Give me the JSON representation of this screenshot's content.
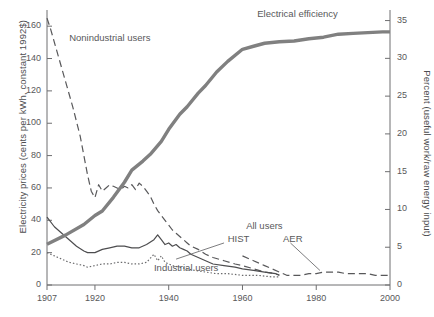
{
  "chart_data": {
    "type": "line",
    "title": "",
    "xlabel": "",
    "ylabel": "Electricity prices (cents per kWh, constant 1992$)",
    "ylabel_right": "Percent (useful work/raw energy input)",
    "xlim": [
      1907,
      2000
    ],
    "ylim": [
      0,
      170
    ],
    "ylim_right": [
      0,
      36.4
    ],
    "grid": false,
    "legend_position": "inline-annotations",
    "xticks": [
      1907,
      1920,
      1940,
      1960,
      1980,
      2000
    ],
    "xtick_labels": [
      "1907",
      "1920",
      "1940",
      "1960",
      "1980",
      "2000"
    ],
    "yticks_left": [
      0,
      20,
      40,
      60,
      80,
      100,
      120,
      140,
      160
    ],
    "ytick_labels_left": [
      "0",
      "20",
      "40",
      "60",
      "80",
      "100",
      "120",
      "140",
      "160"
    ],
    "yticks_right": [
      0,
      5,
      10,
      15,
      20,
      25,
      30,
      35
    ],
    "ytick_labels_right": [
      "0",
      "5",
      "10",
      "15",
      "20",
      "25",
      "30",
      "35"
    ],
    "annotations": [
      {
        "text": "Nonindustrial users",
        "x": 1913,
        "y": 152
      },
      {
        "text": "Electrical efficiency",
        "x": 1964,
        "y": 167
      },
      {
        "text": "Industrial users",
        "x": 1936,
        "y": 10
      },
      {
        "text": "All users",
        "x": 1961,
        "y": 36
      },
      {
        "text": "HIST",
        "x": 1956,
        "y": 28
      },
      {
        "text": "AER",
        "x": 1971,
        "y": 28
      }
    ],
    "series": [
      {
        "name": "Nonindustrial users",
        "style": "dashed",
        "axis": "left",
        "color": "#58585a",
        "points": [
          [
            1907,
            165
          ],
          [
            1908,
            158
          ],
          [
            1910,
            142
          ],
          [
            1912,
            126
          ],
          [
            1914,
            110
          ],
          [
            1916,
            92
          ],
          [
            1917,
            80
          ],
          [
            1918,
            68
          ],
          [
            1919,
            58
          ],
          [
            1920,
            54
          ],
          [
            1921,
            62
          ],
          [
            1922,
            58
          ],
          [
            1923,
            60
          ],
          [
            1924,
            62
          ],
          [
            1925,
            61
          ],
          [
            1926,
            60
          ],
          [
            1927,
            59
          ],
          [
            1928,
            61
          ],
          [
            1929,
            60
          ],
          [
            1930,
            62
          ],
          [
            1931,
            59
          ],
          [
            1932,
            63
          ],
          [
            1933,
            61
          ],
          [
            1934,
            58
          ],
          [
            1935,
            55
          ],
          [
            1936,
            50
          ],
          [
            1937,
            46
          ],
          [
            1938,
            43
          ],
          [
            1939,
            40
          ],
          [
            1940,
            37
          ],
          [
            1941,
            34
          ],
          [
            1942,
            32
          ],
          [
            1943,
            30
          ],
          [
            1944,
            28
          ],
          [
            1945,
            26
          ],
          [
            1946,
            24
          ],
          [
            1948,
            22
          ],
          [
            1950,
            19
          ],
          [
            1952,
            17
          ],
          [
            1955,
            15
          ],
          [
            1958,
            13
          ],
          [
            1960,
            12
          ],
          [
            1963,
            10
          ],
          [
            1966,
            8
          ],
          [
            1969,
            7
          ],
          [
            1970,
            6
          ]
        ]
      },
      {
        "name": "All users HIST",
        "style": "solid",
        "axis": "left",
        "color": "#4d4d4f",
        "points": [
          [
            1907,
            42
          ],
          [
            1909,
            36
          ],
          [
            1911,
            32
          ],
          [
            1913,
            28
          ],
          [
            1915,
            24
          ],
          [
            1917,
            21
          ],
          [
            1918,
            20
          ],
          [
            1920,
            20
          ],
          [
            1922,
            22
          ],
          [
            1924,
            23
          ],
          [
            1926,
            24
          ],
          [
            1928,
            24
          ],
          [
            1930,
            23
          ],
          [
            1932,
            23
          ],
          [
            1934,
            25
          ],
          [
            1936,
            28
          ],
          [
            1937,
            31
          ],
          [
            1938,
            28
          ],
          [
            1939,
            25
          ],
          [
            1940,
            26
          ],
          [
            1941,
            24
          ],
          [
            1942,
            25
          ],
          [
            1943,
            23
          ],
          [
            1944,
            22
          ],
          [
            1945,
            21
          ],
          [
            1946,
            19
          ],
          [
            1948,
            17
          ],
          [
            1950,
            15
          ],
          [
            1952,
            13
          ],
          [
            1955,
            12
          ],
          [
            1958,
            11
          ],
          [
            1960,
            10
          ],
          [
            1963,
            9
          ],
          [
            1966,
            8
          ],
          [
            1969,
            7
          ],
          [
            1970,
            6
          ]
        ]
      },
      {
        "name": "Industrial users",
        "style": "dotted",
        "axis": "left",
        "color": "#6b6b6d",
        "points": [
          [
            1907,
            20
          ],
          [
            1909,
            18
          ],
          [
            1911,
            16
          ],
          [
            1913,
            14
          ],
          [
            1915,
            13
          ],
          [
            1917,
            12
          ],
          [
            1918,
            11
          ],
          [
            1920,
            12
          ],
          [
            1922,
            13
          ],
          [
            1924,
            13
          ],
          [
            1926,
            14
          ],
          [
            1928,
            14
          ],
          [
            1930,
            13
          ],
          [
            1932,
            13
          ],
          [
            1934,
            14
          ],
          [
            1936,
            19
          ],
          [
            1937,
            15
          ],
          [
            1938,
            18
          ],
          [
            1939,
            14
          ],
          [
            1940,
            13
          ],
          [
            1941,
            12
          ],
          [
            1943,
            11
          ],
          [
            1945,
            10
          ],
          [
            1947,
            9
          ],
          [
            1950,
            8
          ],
          [
            1953,
            7
          ],
          [
            1956,
            7
          ],
          [
            1960,
            6
          ],
          [
            1964,
            6
          ],
          [
            1968,
            5
          ],
          [
            1970,
            5
          ]
        ]
      },
      {
        "name": "All users AER",
        "style": "dashed",
        "axis": "left",
        "color": "#58585a",
        "points": [
          [
            1960,
            18
          ],
          [
            1963,
            15
          ],
          [
            1966,
            12
          ],
          [
            1968,
            10
          ],
          [
            1970,
            8
          ],
          [
            1972,
            6
          ],
          [
            1974,
            6
          ],
          [
            1976,
            6
          ],
          [
            1978,
            7
          ],
          [
            1980,
            7
          ],
          [
            1982,
            8
          ],
          [
            1984,
            8
          ],
          [
            1986,
            8
          ],
          [
            1988,
            7
          ],
          [
            1990,
            7
          ],
          [
            1992,
            7
          ],
          [
            1994,
            7
          ],
          [
            1996,
            6
          ],
          [
            1998,
            6
          ],
          [
            2000,
            6
          ]
        ]
      },
      {
        "name": "Electrical efficiency",
        "style": "thick",
        "axis": "right",
        "color": "#808080",
        "points": [
          [
            1907,
            5.4
          ],
          [
            1912,
            6.6
          ],
          [
            1917,
            8.0
          ],
          [
            1920,
            9.2
          ],
          [
            1922,
            9.8
          ],
          [
            1925,
            11.6
          ],
          [
            1928,
            13.6
          ],
          [
            1930,
            15.2
          ],
          [
            1933,
            16.4
          ],
          [
            1935,
            17.3
          ],
          [
            1938,
            19.0
          ],
          [
            1940,
            20.6
          ],
          [
            1943,
            22.6
          ],
          [
            1945,
            23.6
          ],
          [
            1948,
            25.4
          ],
          [
            1950,
            26.4
          ],
          [
            1953,
            28.2
          ],
          [
            1956,
            29.6
          ],
          [
            1960,
            31.2
          ],
          [
            1963,
            31.6
          ],
          [
            1966,
            32.0
          ],
          [
            1970,
            32.2
          ],
          [
            1974,
            32.3
          ],
          [
            1978,
            32.6
          ],
          [
            1982,
            32.8
          ],
          [
            1986,
            33.2
          ],
          [
            1990,
            33.3
          ],
          [
            1994,
            33.4
          ],
          [
            1998,
            33.5
          ],
          [
            2000,
            33.5
          ]
        ]
      }
    ]
  },
  "leaders": [
    {
      "name": "hist-leader",
      "x1": 1955,
      "y1": 26,
      "x2": 1942,
      "y2": 16
    },
    {
      "name": "aer-leader",
      "x1": 1973,
      "y1": 26,
      "x2": 1981,
      "y2": 9
    }
  ]
}
